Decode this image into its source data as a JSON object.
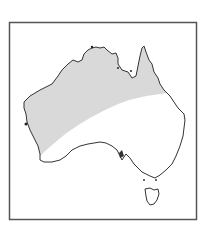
{
  "figure": {
    "frame_color": "#555555",
    "background_color": "#ffffff"
  },
  "map": {
    "land_fill": "#ffffff",
    "coastline_color": "#333333",
    "shaded_region": {
      "fill": "#d9d9d9",
      "extent": "Northern and western Australia band"
    },
    "regions": [
      "mainland",
      "tasmania"
    ]
  }
}
